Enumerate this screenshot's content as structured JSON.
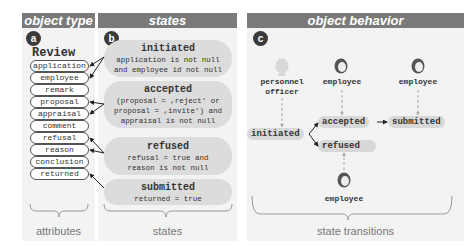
{
  "panels": {
    "a": {
      "header": "object type",
      "badge": "a",
      "footer": "attributes"
    },
    "b": {
      "header": "states",
      "badge": "b",
      "footer": "states"
    },
    "c": {
      "header": "object behavior",
      "badge": "c",
      "footer": "state transitions"
    }
  },
  "object_type": {
    "name": "Review",
    "attributes": [
      "application",
      "employee",
      "remark",
      "proposal",
      "appraisal",
      "comment",
      "refusal",
      "reason",
      "conclusion",
      "returned"
    ]
  },
  "states": [
    {
      "name": "initiated",
      "condition_lines": [
        "application is not null",
        "and employee id not null"
      ]
    },
    {
      "name": "accepted",
      "condition_lines": [
        "(proposal = ,reject' or",
        "proposal = ,invite') and",
        "appraisal is not null"
      ]
    },
    {
      "name": "refused",
      "condition_lines": [
        "refusal = true and",
        "reason is not null"
      ]
    },
    {
      "name": "submitted",
      "condition_lines": [
        "returned = true"
      ]
    }
  ],
  "behavior": {
    "actors": [
      {
        "label_lines": [
          "personnel",
          "officer"
        ],
        "style": "light"
      },
      {
        "label_lines": [
          "employee"
        ],
        "style": "dark"
      },
      {
        "label_lines": [
          "employee"
        ],
        "style": "dark"
      },
      {
        "label_lines": [
          "employee"
        ],
        "style": "dark"
      }
    ],
    "nodes": [
      "initiated",
      "accepted",
      "submitted",
      "refused"
    ]
  },
  "colors": {
    "header_bg": "#7a7a7a",
    "panel_bg": "#f3f3f3",
    "state_bg": "#dcdcdc",
    "badge_bg": "#3a3a3a"
  }
}
